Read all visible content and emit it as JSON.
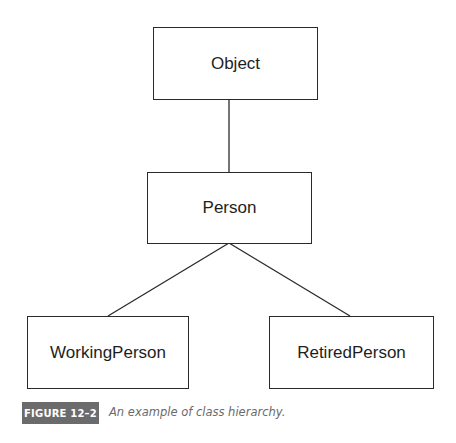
{
  "diagram": {
    "type": "class-hierarchy",
    "nodes": {
      "object": {
        "label": "Object"
      },
      "person": {
        "label": "Person"
      },
      "working_person": {
        "label": "WorkingPerson"
      },
      "retired_person": {
        "label": "RetiredPerson"
      }
    },
    "edges": [
      {
        "from": "Object",
        "to": "Person"
      },
      {
        "from": "Person",
        "to": "WorkingPerson"
      },
      {
        "from": "Person",
        "to": "RetiredPerson"
      }
    ]
  },
  "figure": {
    "label": "FIGURE 12–2",
    "caption": "An example of class hierarchy."
  },
  "colors": {
    "line": "#2a2a2a",
    "label_bg": "#6b6b6b",
    "caption_text": "#6a6a6a"
  }
}
